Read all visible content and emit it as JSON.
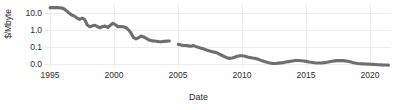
{
  "chart_data": {
    "type": "line",
    "title": "",
    "subtitle": "",
    "xlabel": "Date",
    "ylabel": "$/Mbyte",
    "yscale": "log",
    "grid": true,
    "legend": false,
    "legend_position": "none",
    "line_color": "#6e6e6e",
    "background_color": "#ffffff",
    "grid_color": "#ececec",
    "text_color": "#2b2b2b",
    "xlim": [
      1994.6,
      2021.6
    ],
    "ylim": [
      0.008,
      18.0
    ],
    "xticks": [
      1995,
      2000,
      2005,
      2010,
      2015,
      2020
    ],
    "xticklabels": [
      "1995",
      "2000",
      "2005",
      "2010",
      "2015",
      "2020"
    ],
    "yticks": [
      10.0,
      1.0,
      0.1,
      0.01
    ],
    "yticklabels": [
      "10.0",
      "1.0",
      "0.1",
      "0.0"
    ],
    "series": [
      {
        "name": "segment-1",
        "x": [
          1995.0,
          1995.3,
          1995.6,
          1995.9,
          1996.1,
          1996.3,
          1996.5,
          1996.7,
          1996.9,
          1997.1,
          1997.3,
          1997.5,
          1997.7,
          1997.9,
          1998.1,
          1998.3,
          1998.5,
          1998.7,
          1998.9,
          1999.1,
          1999.3,
          1999.5,
          1999.7,
          1999.9,
          2000.1,
          2000.3,
          2000.5,
          2000.7,
          2000.9,
          2001.1,
          2001.3,
          2001.5,
          2001.7,
          2001.9,
          2002.1,
          2002.3,
          2002.5,
          2002.7,
          2002.9,
          2003.1,
          2003.3,
          2003.5,
          2003.7,
          2003.9,
          2004.1,
          2004.3
        ],
        "y": [
          13.0,
          13.0,
          13.0,
          12.5,
          11.0,
          8.5,
          6.5,
          5.2,
          4.6,
          3.6,
          3.1,
          3.6,
          3.0,
          1.55,
          1.25,
          1.4,
          1.5,
          1.25,
          1.1,
          1.3,
          1.35,
          1.15,
          1.5,
          1.9,
          1.6,
          1.25,
          1.3,
          1.25,
          1.15,
          0.88,
          0.6,
          0.34,
          0.28,
          0.33,
          0.4,
          0.36,
          0.3,
          0.25,
          0.23,
          0.22,
          0.21,
          0.2,
          0.2,
          0.21,
          0.215,
          0.22
        ]
      },
      {
        "name": "segment-2",
        "x": [
          2005.0,
          2005.2,
          2005.4,
          2005.6,
          2005.8,
          2006.0,
          2006.2,
          2006.4,
          2006.6,
          2006.8,
          2007.0,
          2007.2,
          2007.4,
          2007.6,
          2007.8,
          2008.0,
          2008.2,
          2008.4,
          2008.6,
          2008.8,
          2009.0,
          2009.2,
          2009.4,
          2009.6,
          2009.8,
          2010.0,
          2010.2,
          2010.4,
          2010.6,
          2010.8,
          2011.0,
          2011.2,
          2011.4,
          2011.6,
          2011.8,
          2012.0,
          2012.2,
          2012.4,
          2012.6,
          2012.8,
          2013.0,
          2013.2,
          2013.4,
          2013.6,
          2013.8,
          2014.0,
          2014.2,
          2014.4,
          2014.6,
          2014.8,
          2015.0,
          2015.2,
          2015.4,
          2015.6,
          2015.8,
          2016.0,
          2016.2,
          2016.4,
          2016.6,
          2016.8,
          2017.0,
          2017.2,
          2017.4,
          2017.6,
          2017.8,
          2018.0,
          2018.2,
          2018.4,
          2018.6,
          2018.8,
          2019.0,
          2019.2,
          2019.4,
          2019.6,
          2019.8,
          2020.0,
          2020.2,
          2020.4,
          2020.6,
          2020.8,
          2021.0,
          2021.2,
          2021.4
        ],
        "y": [
          0.145,
          0.135,
          0.125,
          0.125,
          0.12,
          0.115,
          0.125,
          0.11,
          0.098,
          0.09,
          0.082,
          0.072,
          0.066,
          0.06,
          0.056,
          0.052,
          0.044,
          0.038,
          0.032,
          0.028,
          0.026,
          0.027,
          0.03,
          0.034,
          0.036,
          0.036,
          0.034,
          0.031,
          0.029,
          0.027,
          0.026,
          0.024,
          0.021,
          0.019,
          0.017,
          0.0155,
          0.0145,
          0.014,
          0.014,
          0.0145,
          0.015,
          0.0155,
          0.0165,
          0.0175,
          0.0185,
          0.0195,
          0.02,
          0.02,
          0.0195,
          0.019,
          0.018,
          0.0168,
          0.016,
          0.0152,
          0.0148,
          0.0148,
          0.015,
          0.0155,
          0.0162,
          0.0172,
          0.0182,
          0.0192,
          0.0198,
          0.02,
          0.0198,
          0.0192,
          0.0182,
          0.017,
          0.0158,
          0.0148,
          0.014,
          0.0135,
          0.0132,
          0.013,
          0.0128,
          0.0126,
          0.0124,
          0.0122,
          0.012,
          0.0118,
          0.0116,
          0.0115,
          0.0114
        ]
      }
    ]
  }
}
